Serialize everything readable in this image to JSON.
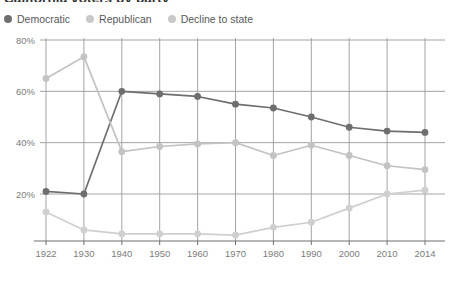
{
  "chart_data": {
    "type": "line",
    "title": "California voters by party",
    "xlabel": "",
    "ylabel": "",
    "x": [
      1922,
      1930,
      1940,
      1950,
      1960,
      1970,
      1980,
      1990,
      2000,
      2010,
      2014
    ],
    "xtick_labels": [
      "1922",
      "1930",
      "1940",
      "1950",
      "1960",
      "1970",
      "1980",
      "1990",
      "2000",
      "2010",
      "2014"
    ],
    "ytick_labels": [
      "20%",
      "40%",
      "60%",
      "80%"
    ],
    "ytick_values": [
      20,
      40,
      60,
      80
    ],
    "ylim": [
      0,
      80
    ],
    "grid": true,
    "legend_position": "top-left",
    "series": [
      {
        "name": "Democratic",
        "color": "#6e6e6e",
        "values": [
          21,
          20,
          60,
          59,
          58,
          55,
          53.5,
          50,
          46,
          44.5,
          44
        ]
      },
      {
        "name": "Republican",
        "color": "#c3c3c3",
        "values": [
          65,
          73.5,
          36.5,
          38.5,
          39.5,
          40,
          35,
          39,
          35,
          31,
          29.5
        ]
      },
      {
        "name": "Decline to state",
        "color": "#cfcfcf",
        "values": [
          13,
          6,
          4.5,
          4.5,
          4.5,
          4,
          7,
          9,
          14.5,
          20,
          21.5
        ]
      }
    ]
  },
  "legend": {
    "items": [
      {
        "label": "Democratic",
        "color": "#6e6e6e"
      },
      {
        "label": "Republican",
        "color": "#c9c9c9"
      },
      {
        "label": "Decline to state",
        "color": "#c9c9c9"
      }
    ]
  },
  "axes": {
    "y_labels": [
      "80%",
      "60%",
      "40%",
      "20%"
    ],
    "x_labels": [
      "1922",
      "1930",
      "1940",
      "1950",
      "1960",
      "1970",
      "1980",
      "1990",
      "2000",
      "2010",
      "2014"
    ]
  },
  "colors": {
    "democratic": "#6e6e6e",
    "republican": "#c3c3c3",
    "decline": "#cfcfcf",
    "grid": "#9a9a9a",
    "axis": "#6f6f6f",
    "text": "#7c7c7c"
  }
}
